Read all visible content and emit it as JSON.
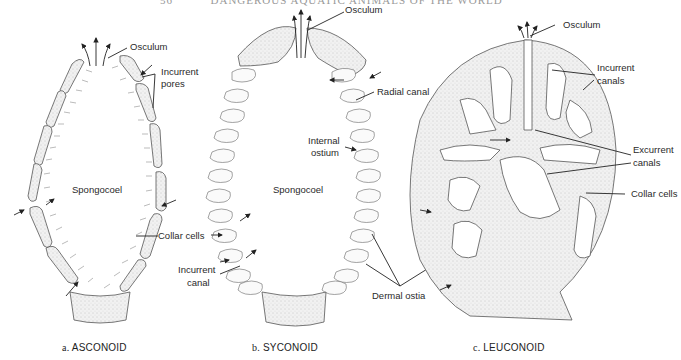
{
  "header": {
    "page_number": "56",
    "running_title": "DANGEROUS AQUATIC ANIMALS OF THE WORLD"
  },
  "panels": [
    {
      "id": "a",
      "caption_prefix": "a.",
      "caption": "ASCONOID",
      "labels": {
        "osculum": "Osculum",
        "incurrent_pores": [
          "Incurrent",
          "pores"
        ],
        "spongocoel": "Spongocoel",
        "collar_cells": "Collar cells"
      }
    },
    {
      "id": "b",
      "caption_prefix": "b.",
      "caption": "SYCONOID",
      "labels": {
        "osculum": "Osculum",
        "radial_canal": "Radial canal",
        "internal_ostium": [
          "Internal",
          "ostium"
        ],
        "spongocoel": "Spongocoel",
        "incurrent_canal": [
          "Incurrent",
          "canal"
        ],
        "dermal_ostia": "Dermal ostia"
      }
    },
    {
      "id": "c",
      "caption_prefix": "c.",
      "caption": "LEUCONOID",
      "labels": {
        "osculum": "Osculum",
        "incurrent_canals": [
          "Incurrent",
          "canals"
        ],
        "excurrent_canals": [
          "Excurrent",
          "canals"
        ],
        "collar_cells": "Collar cells"
      }
    }
  ],
  "colors": {
    "fill": "#ececec",
    "stroke": "#555555",
    "line": "#222222"
  }
}
